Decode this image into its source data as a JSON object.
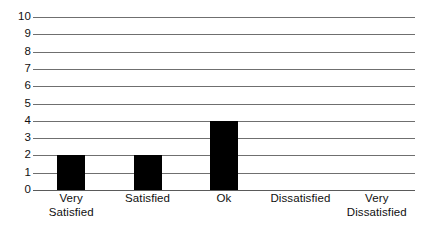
{
  "chart_data": {
    "type": "bar",
    "title": "",
    "subtitle": "",
    "xlabel": "",
    "ylabel": "",
    "categories": [
      "Very\nSatisfied",
      "Satisfied",
      "Ok",
      "Dissatisfied",
      "Very\nDissatisfied"
    ],
    "category_labels_flat": [
      "Very Satisfied",
      "Satisfied",
      "Ok",
      "Dissatisfied",
      "Very Dissatisfied"
    ],
    "values": [
      2,
      2,
      4,
      0,
      0
    ],
    "ylim": [
      0,
      10
    ],
    "y_ticks": [
      "0",
      "1",
      "2",
      "3",
      "4",
      "5",
      "6",
      "7",
      "8",
      "9",
      "10"
    ],
    "y_tick_values": [
      0,
      1,
      2,
      3,
      4,
      5,
      6,
      7,
      8,
      9,
      10
    ],
    "grid": true,
    "grid_axis": "y",
    "legend": false,
    "legend_position": "none",
    "bar_color": "#000000",
    "grid_color": "#6f6f6f",
    "axis_color": "#5a5a5a",
    "background_color": "#ffffff"
  }
}
